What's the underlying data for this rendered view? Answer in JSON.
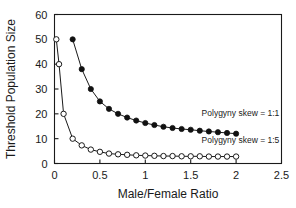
{
  "chart_data": {
    "type": "line",
    "title": "",
    "xlabel": "Male/Female Ratio",
    "ylabel": "Threshold Population Size",
    "xlim": [
      0,
      2.5
    ],
    "ylim": [
      0,
      60
    ],
    "xticks": [
      "0",
      "0.5",
      "1",
      "1.5",
      "2",
      "2.5"
    ],
    "xtick_values": [
      0,
      0.5,
      1,
      1.5,
      2,
      2.5
    ],
    "yticks": [
      "0",
      "10",
      "20",
      "30",
      "40",
      "50",
      "60"
    ],
    "ytick_values": [
      0,
      10,
      20,
      30,
      40,
      50,
      60
    ],
    "grid": false,
    "legend_position": "inside-right-annotations",
    "series": [
      {
        "name": "Polygyny skew = 1:1",
        "marker": "filled-circle",
        "x": [
          0.2,
          0.3,
          0.4,
          0.5,
          0.6,
          0.7,
          0.8,
          0.9,
          1.0,
          1.1,
          1.2,
          1.3,
          1.4,
          1.5,
          1.6,
          1.7,
          1.8,
          1.9,
          2.0
        ],
        "values": [
          50,
          38,
          30,
          25,
          22,
          20,
          18.5,
          17.3,
          16.3,
          15.5,
          14.8,
          14.3,
          13.9,
          13.6,
          13.2,
          12.9,
          12.6,
          12.3,
          12.0
        ]
      },
      {
        "name": "Polygyny skew = 1:5",
        "marker": "open-circle",
        "x": [
          0.02,
          0.05,
          0.1,
          0.2,
          0.3,
          0.4,
          0.5,
          0.6,
          0.7,
          0.8,
          0.9,
          1.0,
          1.1,
          1.2,
          1.3,
          1.4,
          1.5,
          1.6,
          1.7,
          1.8,
          1.9,
          2.0
        ],
        "values": [
          50,
          40,
          20,
          10,
          7.3,
          5.6,
          4.7,
          4.0,
          3.7,
          3.5,
          3.3,
          3.2,
          3.1,
          3.0,
          3.0,
          2.9,
          2.9,
          2.9,
          2.8,
          2.8,
          2.8,
          2.8
        ]
      }
    ],
    "annotations": [
      {
        "text": "Polygyny skew = 1:1",
        "x": 1.62,
        "y": 19.0
      },
      {
        "text": "Polygyny skew = 1:5",
        "x": 1.62,
        "y": 8.2
      }
    ],
    "colors": {
      "axis": "#1a1a1a",
      "series_1": "#111111",
      "series_2": "#1a1a1a",
      "background": "#ffffff"
    }
  }
}
